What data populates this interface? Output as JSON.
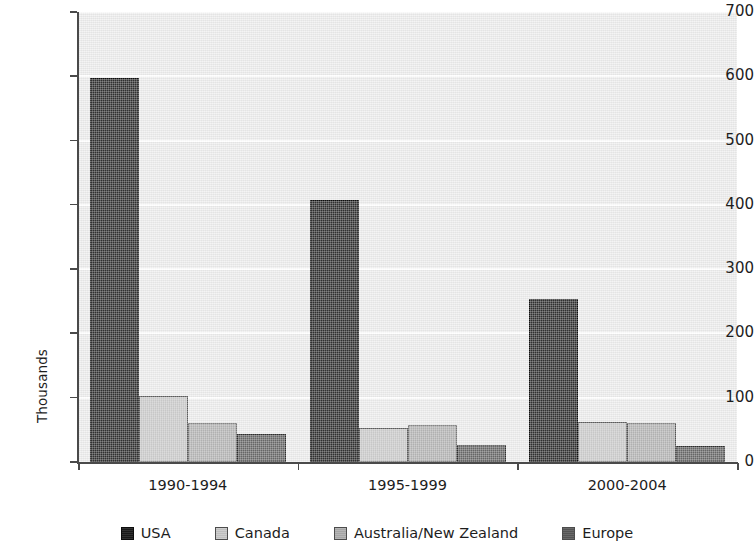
{
  "chart_data": {
    "type": "bar",
    "title": "",
    "subtitle": "",
    "xlabel": "",
    "ylabel": "Thousands",
    "ylim": [
      0,
      700
    ],
    "ytick_step": 100,
    "yticks": [
      0,
      100,
      200,
      300,
      400,
      500,
      600,
      700
    ],
    "ytick_labels": [
      "0",
      "100",
      "200",
      "300",
      "400",
      "500",
      "600",
      "700"
    ],
    "categories": [
      "1990-1994",
      "1995-1999",
      "2000-2004"
    ],
    "series": [
      {
        "name": "USA",
        "color": "#1a1a1a",
        "values": [
          598,
          407,
          253
        ]
      },
      {
        "name": "Canada",
        "color": "#c8c8c8",
        "values": [
          103,
          53,
          62
        ]
      },
      {
        "name": "Australia/New Zealand",
        "color": "#aeaeae",
        "values": [
          60,
          58,
          60
        ]
      },
      {
        "name": "Europe",
        "color": "#585858",
        "values": [
          43,
          27,
          25
        ]
      }
    ],
    "grid": {
      "horizontal": true,
      "vertical": false,
      "color": "#ffffff"
    },
    "plot_background": "#ebebeb",
    "legend": {
      "position": "bottom",
      "orientation": "horizontal"
    },
    "annotations": []
  },
  "legend": {
    "items": [
      {
        "label": "USA"
      },
      {
        "label": "Canada"
      },
      {
        "label": "Australia/New Zealand"
      },
      {
        "label": "Europe"
      }
    ]
  }
}
